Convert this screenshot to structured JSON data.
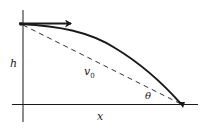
{
  "diagram": {
    "colors": {
      "stroke": "#1a1a1a",
      "background": "#ffffff"
    },
    "labels": {
      "height": "h",
      "velocity": "v",
      "velocity_sub": "0",
      "angle": "θ",
      "distance": "x"
    },
    "elements": [
      {
        "id": "vertical-axis",
        "type": "line"
      },
      {
        "id": "horizontal-axis",
        "type": "line"
      },
      {
        "id": "initial-velocity-arrow",
        "type": "arrow",
        "direction": "right"
      },
      {
        "id": "trajectory",
        "type": "curve",
        "shape": "parabolic"
      },
      {
        "id": "line-of-sight",
        "type": "dashed-line"
      }
    ]
  }
}
